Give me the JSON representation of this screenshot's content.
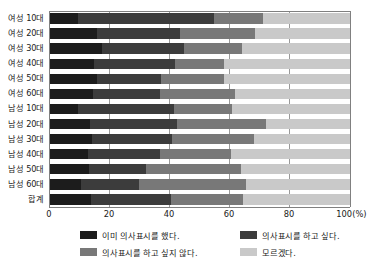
{
  "chart_data": {
    "type": "bar",
    "orientation": "horizontal",
    "stacked": true,
    "normalized": true,
    "title": "",
    "subtitle": "",
    "xlabel": "",
    "ylabel": "",
    "xlim": [
      0,
      100
    ],
    "xticks": [
      0,
      20,
      40,
      60,
      80,
      100
    ],
    "xtick_labels": [
      "0",
      "20",
      "40",
      "60",
      "80",
      "100(%)"
    ],
    "unit": "(%)",
    "grid": true,
    "grid_axis": "x",
    "legend_position": "bottom",
    "categories": [
      "여성 10대",
      "여성 20대",
      "여성 30대",
      "여성 40대",
      "여성 50대",
      "여성 60대",
      "남성 10대",
      "남성 20대",
      "남성 30대",
      "남성 40대",
      "남성 50대",
      "남성 60대",
      "합계"
    ],
    "series": [
      {
        "name": "이미 의사표시를 했다.",
        "color": "#1c1c1c",
        "values": [
          9.2,
          15.8,
          17.4,
          14.6,
          15.8,
          14.2,
          9.4,
          13.2,
          14.0,
          12.8,
          13.0,
          10.4,
          13.6
        ]
      },
      {
        "name": "의사표시를 하고 싶다.",
        "color": "#3c3c3c",
        "values": [
          45.4,
          27.6,
          27.2,
          27.2,
          21.2,
          22.4,
          32.0,
          29.0,
          26.8,
          24.0,
          19.0,
          19.4,
          26.6
        ]
      },
      {
        "name": "의사표시를 하고 싶지 않다.",
        "color": "#787878",
        "values": [
          16.4,
          25.0,
          19.4,
          16.2,
          21.0,
          25.2,
          19.4,
          29.8,
          27.2,
          23.6,
          31.8,
          35.4,
          24.0
        ]
      },
      {
        "name": "모르겠다.",
        "color": "#c9c9c9",
        "values": [
          29.0,
          31.6,
          36.0,
          42.0,
          42.0,
          38.2,
          39.2,
          28.0,
          32.0,
          39.6,
          36.2,
          34.8,
          35.8
        ]
      }
    ]
  },
  "legend": {
    "items": [
      {
        "label": "이미 의사표시를 했다.",
        "color": "#1c1c1c"
      },
      {
        "label": "의사표시를 하고 싶다.",
        "color": "#3c3c3c"
      },
      {
        "label": "의사표시를 하고 싶지 않다.",
        "color": "#787878"
      },
      {
        "label": "모르겠다.",
        "color": "#c9c9c9"
      }
    ]
  }
}
